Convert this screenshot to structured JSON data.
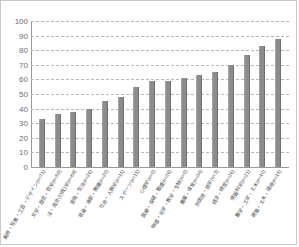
{
  "chart_data": {
    "type": "bar",
    "title": "",
    "subtitle": "",
    "xlabel": "",
    "ylabel": "",
    "ylim": [
      0,
      100
    ],
    "ytick_step": 10,
    "yticks": [
      "100",
      "90",
      "80",
      "70",
      "60",
      "50",
      "40",
      "30",
      "20",
      "10",
      "0"
    ],
    "grid": true,
    "legend": false,
    "bar_color": "#8c8c8c",
    "categories": [
      "美術・写真・工芸・デザイン(n=71)",
      "文学・歴史・哲学(n=59)",
      "法・政治(行政)学(n=68)",
      "家政・生活(n=26)",
      "音楽・演劇・舞踊(n=29)",
      "社会・人類学(n=11)",
      "スポーツ(n=11)",
      "心理学(n=9)",
      "医療・保健・看護(n=28)",
      "物理・化学・数学・生物(n=9)",
      "農業・保育(n=34)",
      "外国語・語学(n=3)",
      "経済・経営(n=26)",
      "情報科学(n=21)",
      "農学・工学・土木(n=10)",
      "建築・土木・環境(n=15)"
    ],
    "values": [
      33,
      36,
      38,
      40,
      45,
      48,
      55,
      59,
      59,
      61,
      63,
      65,
      70,
      77,
      83,
      88
    ]
  }
}
